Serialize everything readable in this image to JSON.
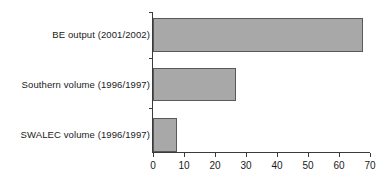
{
  "chart_data": {
    "type": "bar",
    "orientation": "horizontal",
    "title": "",
    "subtitle": "",
    "xlabel": "",
    "ylabel": "",
    "categories": [
      "BE output (2001/2002)",
      "Southern volume (1996/1997)",
      "SWALEC volume (1996/1997)"
    ],
    "values": [
      67.7,
      26.8,
      7.7
    ],
    "series": [
      {
        "name": "",
        "values": [
          67.7,
          26.8,
          7.7
        ]
      }
    ],
    "xlim": [
      0,
      70
    ],
    "xticks": [
      0,
      10,
      20,
      30,
      40,
      50,
      60,
      70
    ],
    "xtick_labels": [
      "0",
      "10",
      "20",
      "30",
      "40",
      "50",
      "60",
      "70"
    ],
    "grid": false,
    "legend": false,
    "legend_position": "none",
    "bar_fill_color": "#a8a8a8",
    "bar_edge_color": "#595959",
    "axis_color": "#3a3a3a",
    "background_color": "#ffffff",
    "text_color": "#1a1a1a"
  }
}
